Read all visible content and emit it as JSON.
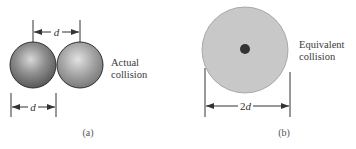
{
  "figure": {
    "panel_a": {
      "caption": "(a)",
      "label_line1": "Actual",
      "label_line2": "collision",
      "top_dimension": "d",
      "bottom_dimension": "d"
    },
    "panel_b": {
      "caption": "(b)",
      "label_line1": "Equivalent",
      "label_line2": "collision",
      "dimension": "2d"
    }
  },
  "colors": {
    "sphere_dark": "#5c5c5c",
    "sphere_light": "#8a8a8a",
    "equivalent_disk": "#c9c9c9",
    "center_dot": "#333333",
    "line": "#333333"
  }
}
